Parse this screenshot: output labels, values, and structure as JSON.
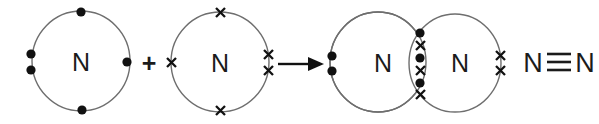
{
  "diagram": {
    "type": "dot-and-cross",
    "background_color": "#ffffff",
    "shell_color": "#6e6e6e",
    "electron_color": "#111111",
    "text_color": "#1b1b1b",
    "equation_text": "N + N -> N2",
    "operators": {
      "plus": "+",
      "arrow": "→"
    },
    "reactants": [
      {
        "id": "reactant-1",
        "atom_label": "N",
        "electron_symbol": "dot",
        "electron_count": 5,
        "electrons": [
          {
            "position": "top",
            "symbol": "dot"
          },
          {
            "position": "left-upper",
            "symbol": "dot"
          },
          {
            "position": "left-lower",
            "symbol": "dot"
          },
          {
            "position": "right",
            "symbol": "dot"
          },
          {
            "position": "bottom",
            "symbol": "dot"
          }
        ],
        "lone_pairs": 1,
        "unpaired_electrons": 3
      },
      {
        "id": "reactant-2",
        "atom_label": "N",
        "electron_symbol": "cross",
        "electron_count": 5,
        "electrons": [
          {
            "position": "top",
            "symbol": "cross"
          },
          {
            "position": "left",
            "symbol": "cross"
          },
          {
            "position": "right-upper",
            "symbol": "cross"
          },
          {
            "position": "right-lower",
            "symbol": "cross"
          },
          {
            "position": "bottom",
            "symbol": "cross"
          }
        ],
        "lone_pairs": 1,
        "unpaired_electrons": 3
      }
    ],
    "product": {
      "id": "product-nitrogen-molecule",
      "left_atom_label": "N",
      "right_atom_label": "N",
      "left_lone_pair": [
        {
          "symbol": "dot"
        },
        {
          "symbol": "dot"
        }
      ],
      "right_lone_pair": [
        {
          "symbol": "cross"
        },
        {
          "symbol": "cross"
        }
      ],
      "overlap_region": {
        "name": "shared-electron-lens",
        "bonding_pairs": 3,
        "bond_name": "triple bond",
        "symbols_top_to_bottom": [
          "dot",
          "cross",
          "dot",
          "cross",
          "dot",
          "cross"
        ]
      }
    },
    "structural_formula": {
      "left_atom": "N",
      "right_atom": "N",
      "bond_symbol": "≡",
      "bond_order": 3,
      "text": "N≡N"
    }
  }
}
